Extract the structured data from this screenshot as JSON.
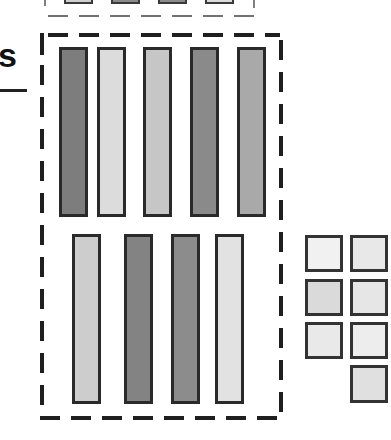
{
  "diagram": {
    "label": "s",
    "top_row_bars": [
      {
        "id": "bar-1",
        "shade": "#7d7d7d"
      },
      {
        "id": "bar-2",
        "shade": "#dcdcdc"
      },
      {
        "id": "bar-3",
        "shade": "#c6c6c6"
      },
      {
        "id": "bar-4",
        "shade": "#8a8a8a"
      },
      {
        "id": "bar-5",
        "shade": "#a9a9a9"
      }
    ],
    "bottom_row_bars": [
      {
        "id": "bar-6",
        "shade": "#cdcdcd"
      },
      {
        "id": "bar-7",
        "shade": "#838383"
      },
      {
        "id": "bar-8",
        "shade": "#8c8c8c"
      },
      {
        "id": "bar-9",
        "shade": "#e2e2e2"
      }
    ],
    "squares": [
      {
        "id": "sq-1",
        "shade": "#f1f1f1"
      },
      {
        "id": "sq-2",
        "shade": "#e8e8e8"
      },
      {
        "id": "sq-3",
        "shade": "#dadada"
      },
      {
        "id": "sq-4",
        "shade": "#e6e6e6"
      },
      {
        "id": "sq-5",
        "shade": "#e9e9e9"
      },
      {
        "id": "sq-6",
        "shade": "#ededed"
      },
      {
        "id": "sq-7",
        "shade": "#e0e0e0"
      }
    ],
    "top_partial_boxes": [
      {
        "id": "top-box-1",
        "shade": "#cfcfcf"
      },
      {
        "id": "top-box-2",
        "shade": "#8a8a8a"
      },
      {
        "id": "top-box-3",
        "shade": "#8a8a8a"
      },
      {
        "id": "top-box-4",
        "shade": "#dddddd"
      }
    ],
    "colors": {
      "stroke": "#2a2a2a",
      "dash": "#1f1f1f",
      "background": "#ffffff"
    }
  }
}
